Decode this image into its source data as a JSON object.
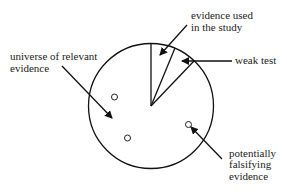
{
  "diagram": {
    "labels": {
      "universe": [
        "universe of relevant",
        "evidence"
      ],
      "evidence_used": [
        "evidence used",
        "in the study"
      ],
      "weak_test": "weak test",
      "falsifying": [
        "potentially",
        "falsifying",
        "evidence"
      ]
    },
    "colors": {
      "stroke": "#111111",
      "text": "#222222",
      "background": "#ffffff"
    }
  }
}
